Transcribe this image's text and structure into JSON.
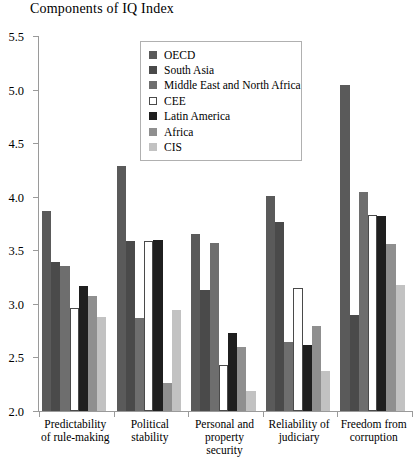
{
  "chart_data": {
    "type": "bar",
    "title": "Components of IQ Index",
    "xlabel": "",
    "ylabel": "",
    "ylim": [
      2.0,
      5.5
    ],
    "yticks": [
      "2.0",
      "2.5",
      "3.0",
      "3.5",
      "4.0",
      "4.5",
      "5.0",
      "5.5"
    ],
    "grid": false,
    "legend_position": "upper-center",
    "categories": [
      "Predictability\nof rule-making",
      "Political\nstability",
      "Personal and\nproperty security",
      "Reliability of\njudiciary",
      "Freedom from\ncorruption"
    ],
    "category_lines": [
      [
        "Predictability",
        "of rule-making"
      ],
      [
        "Political",
        "stability"
      ],
      [
        "Personal and",
        "property security"
      ],
      [
        "Reliability of",
        "judiciary"
      ],
      [
        "Freedom from",
        "corruption"
      ]
    ],
    "series": [
      {
        "name": "OECD",
        "color": "#5a5a5a",
        "values": [
          3.87,
          4.29,
          3.65,
          4.01,
          5.04
        ]
      },
      {
        "name": "South Asia",
        "color": "#4a4a4a",
        "values": [
          3.39,
          3.59,
          3.13,
          3.76,
          2.9
        ]
      },
      {
        "name": "Middle East and North Africa",
        "color": "#6e6e6e",
        "values": [
          3.35,
          2.87,
          3.57,
          2.64,
          4.04
        ]
      },
      {
        "name": "CEE",
        "color": "#ffffff",
        "values": [
          2.96,
          3.59,
          2.43,
          3.15,
          3.83
        ]
      },
      {
        "name": "Latin America",
        "color": "#1f1f1f",
        "values": [
          3.17,
          3.6,
          2.73,
          2.62,
          3.82
        ]
      },
      {
        "name": "Africa",
        "color": "#8f8f8f",
        "values": [
          3.07,
          2.26,
          2.6,
          2.79,
          3.56
        ]
      },
      {
        "name": "CIS",
        "color": "#c2c2c2",
        "values": [
          2.88,
          2.94,
          2.19,
          2.37,
          3.18
        ]
      }
    ]
  },
  "legend": {
    "items": [
      {
        "label": "OECD"
      },
      {
        "label": "South Asia"
      },
      {
        "label": "Middle East and North Africa"
      },
      {
        "label": "CEE"
      },
      {
        "label": "Latin America"
      },
      {
        "label": "Africa"
      },
      {
        "label": "CIS"
      }
    ]
  }
}
